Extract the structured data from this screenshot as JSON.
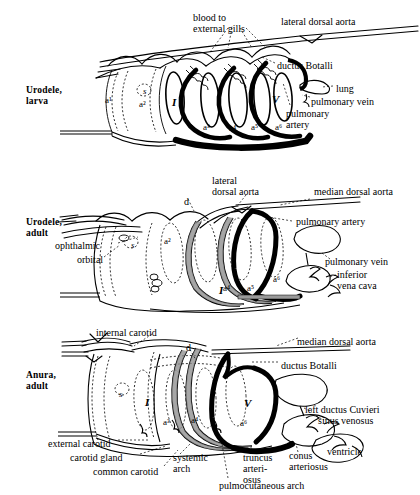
{
  "figure": {
    "panels": [
      {
        "id": "urodele-larva",
        "title": "Urodele,\nlarva",
        "labels": [
          {
            "name": "blood-to-external-gills",
            "text": "blood to\nexternal gills",
            "x": 193,
            "y": 12
          },
          {
            "name": "lateral-dorsal-aorta",
            "text": "lateral dorsal aorta",
            "x": 281,
            "y": 16
          },
          {
            "name": "ductus-botalli",
            "text": "ductus Botalli",
            "x": 277,
            "y": 60
          },
          {
            "name": "lung",
            "text": "lung",
            "x": 336,
            "y": 83
          },
          {
            "name": "pulmonary-vein",
            "text": "pulmonary vein",
            "x": 311,
            "y": 96
          },
          {
            "name": "pulmonary-artery",
            "text": "pulmonary\nartery",
            "x": 286,
            "y": 108
          }
        ],
        "arch_marks": [
          {
            "name": "spiracle-s",
            "text": "s",
            "x": 143,
            "y": 86,
            "style": "italic"
          },
          {
            "name": "arch-a1",
            "text": "a¹",
            "x": 105,
            "y": 95,
            "style": "plain"
          },
          {
            "name": "arch-a2",
            "text": "a²",
            "x": 139,
            "y": 99,
            "style": "plain"
          },
          {
            "name": "arch-roman-I",
            "text": "I",
            "x": 172,
            "y": 97,
            "style": "bolditalic"
          },
          {
            "name": "arch-a3",
            "text": "a³",
            "x": 203,
            "y": 122,
            "style": "plain"
          },
          {
            "name": "arch-a4",
            "text": "a⁴",
            "x": 229,
            "y": 123,
            "style": "plain"
          },
          {
            "name": "arch-a5",
            "text": "a⁵",
            "x": 251,
            "y": 122,
            "style": "plain"
          },
          {
            "name": "arch-a6",
            "text": "a⁶",
            "x": 275,
            "y": 122,
            "style": "plain"
          },
          {
            "name": "arch-roman-V",
            "text": "V",
            "x": 272,
            "y": 94,
            "style": "bolditalic"
          }
        ]
      },
      {
        "id": "urodele-adult",
        "title": "Urodele,\nadult",
        "labels": [
          {
            "name": "lateral-dorsal-aorta",
            "text": "lateral\ndorsal aorta",
            "x": 212,
            "y": 175
          },
          {
            "name": "median-dorsal-aorta",
            "text": "median dorsal aorta",
            "x": 314,
            "y": 186
          },
          {
            "name": "ductus-d",
            "text": "d",
            "x": 184,
            "y": 196
          },
          {
            "name": "pulmonary-artery",
            "text": "pulmonary artery",
            "x": 296,
            "y": 216
          },
          {
            "name": "ophthalmic",
            "text": "ophthalmic",
            "x": 55,
            "y": 240
          },
          {
            "name": "orbital",
            "text": "orbital",
            "x": 77,
            "y": 254
          },
          {
            "name": "pulmonary-vein",
            "text": "pulmonary vein",
            "x": 325,
            "y": 256
          },
          {
            "name": "inferior-vena-cava",
            "text": "inferior\nvena cava",
            "x": 337,
            "y": 269
          }
        ],
        "arch_marks": [
          {
            "name": "spiracle-s",
            "text": "s",
            "x": 131,
            "y": 240,
            "style": "italic"
          },
          {
            "name": "arch-a2",
            "text": "a²",
            "x": 164,
            "y": 236,
            "style": "plain"
          },
          {
            "name": "arch-roman-I",
            "text": "I",
            "x": 219,
            "y": 285,
            "style": "bolditalic"
          },
          {
            "name": "arch-a4",
            "text": "a⁴",
            "x": 223,
            "y": 283,
            "style": "plain"
          },
          {
            "name": "arch-a5",
            "text": "a⁵",
            "x": 247,
            "y": 283,
            "style": "plain"
          },
          {
            "name": "arch-a6",
            "text": "a⁶",
            "x": 273,
            "y": 274,
            "style": "plain"
          }
        ]
      },
      {
        "id": "anura-adult",
        "title": "Anura,\nadult",
        "labels": [
          {
            "name": "internal-carotid",
            "text": "internal carotid",
            "x": 96,
            "y": 327
          },
          {
            "name": "median-dorsal-aorta",
            "text": "median dorsal  aorta",
            "x": 297,
            "y": 336
          },
          {
            "name": "ductus-d",
            "text": "d",
            "x": 186,
            "y": 342
          },
          {
            "name": "ductus-botalli",
            "text": "ductus Botalli",
            "x": 281,
            "y": 360
          },
          {
            "name": "left-ductus-cuvieri",
            "text": "left  ductus Cuvieri",
            "x": 305,
            "y": 404
          },
          {
            "name": "sinus-venosus",
            "text": "sinus venosus",
            "x": 318,
            "y": 415
          },
          {
            "name": "external-carotid",
            "text": "external carotid",
            "x": 48,
            "y": 438
          },
          {
            "name": "carotid-gland",
            "text": "carotid gland",
            "x": 70,
            "y": 452
          },
          {
            "name": "common-carotid",
            "text": "common carotid",
            "x": 93,
            "y": 466
          },
          {
            "name": "systemic-arch",
            "text": "systemic\narch",
            "x": 173,
            "y": 452
          },
          {
            "name": "truncus-arteriosus",
            "text": "truncus\narteri-\nosus",
            "x": 243,
            "y": 452
          },
          {
            "name": "conus-arteriosus",
            "text": "conus\narteriosus",
            "x": 289,
            "y": 450
          },
          {
            "name": "ventricle",
            "text": "ventricle",
            "x": 327,
            "y": 446
          },
          {
            "name": "pulmocutaneous-arch",
            "text": "pulmocutaneous arch",
            "x": 219,
            "y": 480
          }
        ],
        "arch_marks": [
          {
            "name": "spiracle-s",
            "text": "s",
            "x": 119,
            "y": 389,
            "style": "italic"
          },
          {
            "name": "arch-roman-I",
            "text": "I",
            "x": 145,
            "y": 397,
            "style": "bolditalic"
          },
          {
            "name": "arch-a3",
            "text": "a³",
            "x": 163,
            "y": 417,
            "style": "plain"
          },
          {
            "name": "arch-a4",
            "text": "a⁴",
            "x": 191,
            "y": 415,
            "style": "plain"
          },
          {
            "name": "arch-roman-V",
            "text": "V",
            "x": 244,
            "y": 398,
            "style": "bolditalic"
          },
          {
            "name": "arch-a6",
            "text": "a⁶",
            "x": 240,
            "y": 418,
            "style": "plain"
          }
        ]
      }
    ],
    "colors": {
      "ink": "#000000",
      "background": "#ffffff",
      "vein_fill": "#9a9a9a"
    }
  }
}
